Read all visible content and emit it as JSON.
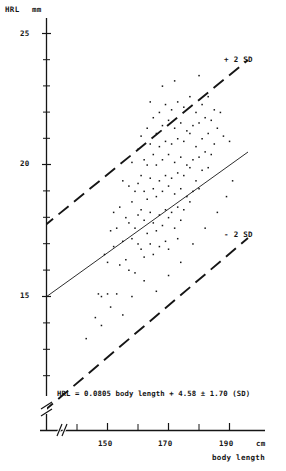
{
  "figure": {
    "title": "",
    "background": "#ffffff",
    "ink": "#151515"
  },
  "axes": {
    "y": {
      "name": "HRL",
      "unit": "mm",
      "ticks": [
        "25",
        "20",
        "15"
      ],
      "tick_values": [
        25,
        20,
        15
      ],
      "has_break": true
    },
    "x": {
      "name": "body length",
      "unit": "cm",
      "ticks": [
        "150",
        "170",
        "190"
      ],
      "tick_values": [
        150,
        170,
        190
      ],
      "has_break": true
    }
  },
  "annotations": {
    "upper_band": "+ 2 SD",
    "lower_band": "- 2 SD",
    "equation": "HRL = 0.0805 body length + 4.58 ± 1.70 (SD)"
  },
  "chart_data": {
    "type": "scatter",
    "title": "",
    "xlabel": "body length",
    "ylabel": "HRL",
    "xunit": "cm",
    "yunit": "mm",
    "xlim": [
      138,
      200
    ],
    "ylim": [
      11.5,
      25.8
    ],
    "grid": false,
    "legend": "inline-annotations",
    "axis_breaks": {
      "x": true,
      "y": true
    },
    "regression": {
      "slope": 0.0805,
      "intercept": 4.58,
      "sd": 1.7,
      "band_multiplier": 2,
      "equation": "HRL = 0.0805 body length + 4.58 ± 1.70 (SD)",
      "line_style": "solid",
      "band_style": "dashed"
    },
    "series": [
      {
        "name": "observations",
        "marker": "dot",
        "points": [
          [
            143,
            13.4
          ],
          [
            146,
            14.2
          ],
          [
            147,
            15.1
          ],
          [
            148,
            15.0
          ],
          [
            149,
            16.6
          ],
          [
            150,
            15.1
          ],
          [
            150,
            16.3
          ],
          [
            151,
            17.5
          ],
          [
            152,
            18.2
          ],
          [
            152,
            16.9
          ],
          [
            153,
            15.1
          ],
          [
            153,
            17.6
          ],
          [
            154,
            18.4
          ],
          [
            154,
            16.2
          ],
          [
            155,
            19.4
          ],
          [
            155,
            17.1
          ],
          [
            156,
            18.0
          ],
          [
            156,
            16.4
          ],
          [
            157,
            19.2
          ],
          [
            157,
            17.8
          ],
          [
            157,
            16.0
          ],
          [
            158,
            20.1
          ],
          [
            158,
            18.6
          ],
          [
            158,
            17.2
          ],
          [
            159,
            19.0
          ],
          [
            159,
            17.6
          ],
          [
            159,
            15.9
          ],
          [
            160,
            20.6
          ],
          [
            160,
            19.3
          ],
          [
            160,
            18.1
          ],
          [
            160,
            17.0
          ],
          [
            161,
            21.1
          ],
          [
            161,
            19.6
          ],
          [
            161,
            18.3
          ],
          [
            161,
            16.8
          ],
          [
            162,
            20.2
          ],
          [
            162,
            19.0
          ],
          [
            162,
            17.9
          ],
          [
            162,
            16.5
          ],
          [
            163,
            21.4
          ],
          [
            163,
            20.0
          ],
          [
            163,
            18.7
          ],
          [
            163,
            17.4
          ],
          [
            164,
            20.8
          ],
          [
            164,
            19.5
          ],
          [
            164,
            18.2
          ],
          [
            164,
            17.0
          ],
          [
            165,
            21.8
          ],
          [
            165,
            20.4
          ],
          [
            165,
            19.1
          ],
          [
            165,
            17.8
          ],
          [
            165,
            16.6
          ],
          [
            166,
            21.2
          ],
          [
            166,
            20.0
          ],
          [
            166,
            18.8
          ],
          [
            166,
            17.5
          ],
          [
            167,
            22.0
          ],
          [
            167,
            20.7
          ],
          [
            167,
            19.4
          ],
          [
            167,
            18.1
          ],
          [
            167,
            16.9
          ],
          [
            168,
            21.5
          ],
          [
            168,
            20.2
          ],
          [
            168,
            19.0
          ],
          [
            168,
            17.7
          ],
          [
            169,
            22.3
          ],
          [
            169,
            20.9
          ],
          [
            169,
            19.6
          ],
          [
            169,
            18.3
          ],
          [
            169,
            17.1
          ],
          [
            170,
            21.7
          ],
          [
            170,
            20.4
          ],
          [
            170,
            19.2
          ],
          [
            170,
            18.0
          ],
          [
            170,
            16.8
          ],
          [
            171,
            22.1
          ],
          [
            171,
            20.8
          ],
          [
            171,
            19.5
          ],
          [
            171,
            18.2
          ],
          [
            172,
            21.4
          ],
          [
            172,
            20.1
          ],
          [
            172,
            18.9
          ],
          [
            172,
            17.6
          ],
          [
            173,
            22.4
          ],
          [
            173,
            21.0
          ],
          [
            173,
            19.7
          ],
          [
            173,
            18.4
          ],
          [
            173,
            17.2
          ],
          [
            174,
            21.6
          ],
          [
            174,
            20.3
          ],
          [
            174,
            19.1
          ],
          [
            174,
            17.9
          ],
          [
            175,
            22.2
          ],
          [
            175,
            20.9
          ],
          [
            175,
            19.6
          ],
          [
            175,
            18.3
          ],
          [
            176,
            21.3
          ],
          [
            176,
            20.0
          ],
          [
            176,
            18.8
          ],
          [
            177,
            22.6
          ],
          [
            177,
            21.2
          ],
          [
            177,
            19.9
          ],
          [
            177,
            18.6
          ],
          [
            178,
            21.5
          ],
          [
            178,
            20.2
          ],
          [
            178,
            19.0
          ],
          [
            179,
            22.0
          ],
          [
            179,
            20.7
          ],
          [
            179,
            19.4
          ],
          [
            180,
            23.4
          ],
          [
            180,
            21.6
          ],
          [
            180,
            20.3
          ],
          [
            180,
            19.1
          ],
          [
            181,
            22.3
          ],
          [
            181,
            21.0
          ],
          [
            181,
            19.8
          ],
          [
            182,
            21.8
          ],
          [
            182,
            20.5
          ],
          [
            183,
            22.6
          ],
          [
            183,
            21.2
          ],
          [
            183,
            19.9
          ],
          [
            184,
            21.7
          ],
          [
            184,
            20.4
          ],
          [
            185,
            22.1
          ],
          [
            185,
            20.8
          ],
          [
            186,
            21.4
          ],
          [
            187,
            22.0
          ],
          [
            188,
            21.1
          ],
          [
            190,
            20.9
          ],
          [
            191,
            19.4
          ],
          [
            148,
            13.9
          ],
          [
            151,
            14.6
          ],
          [
            155,
            14.3
          ],
          [
            158,
            15.0
          ],
          [
            162,
            15.6
          ],
          [
            166,
            15.2
          ],
          [
            170,
            15.8
          ],
          [
            174,
            16.3
          ],
          [
            178,
            17.0
          ],
          [
            182,
            17.6
          ],
          [
            186,
            18.2
          ],
          [
            189,
            18.8
          ],
          [
            164,
            22.4
          ],
          [
            168,
            23.0
          ],
          [
            172,
            23.2
          ]
        ]
      }
    ]
  }
}
